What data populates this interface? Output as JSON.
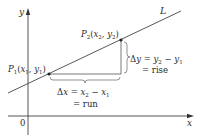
{
  "diagram": {
    "axes": {
      "x_label": "x",
      "y_label": "y",
      "origin_label": "0"
    },
    "line": {
      "label": "L"
    },
    "points": [
      {
        "id": "P1",
        "name": "P",
        "sub": "1",
        "coords_label_x": "x",
        "coords_sub_x": "1",
        "coords_label_y": "y",
        "coords_sub_y": "1"
      },
      {
        "id": "P2",
        "name": "P",
        "sub": "2",
        "coords_label_x": "x",
        "coords_sub_x": "2",
        "coords_label_y": "y",
        "coords_sub_y": "2"
      }
    ],
    "rise": {
      "delta": "Δ",
      "var": "y",
      "eq": " = ",
      "a": "y",
      "a_sub": "2",
      "minus": " − ",
      "b": "y",
      "b_sub": "1",
      "word": "= rise"
    },
    "run": {
      "delta": "Δ",
      "var": "x",
      "eq": " = ",
      "a": "x",
      "a_sub": "2",
      "minus": " − ",
      "b": "x",
      "b_sub": "1",
      "word": "= run"
    },
    "colors": {
      "ink": "#2b2b2b",
      "background": "#ffffff"
    }
  }
}
